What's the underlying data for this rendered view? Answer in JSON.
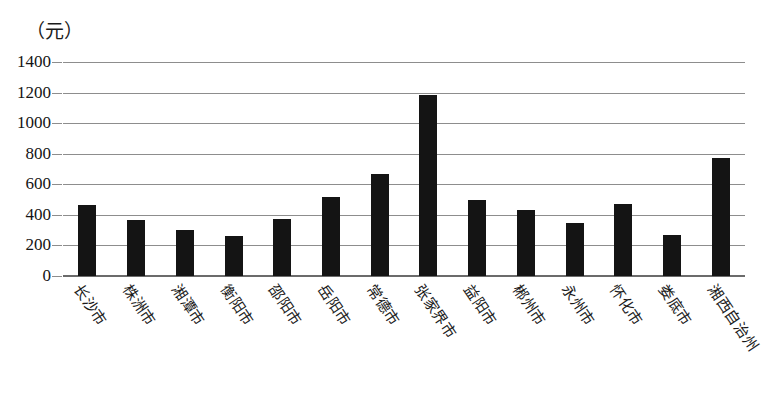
{
  "chart_data": {
    "type": "bar",
    "title": "",
    "subtitle": "",
    "unit_label": "（元）",
    "xlabel": "",
    "ylabel": "",
    "ylim": [
      0,
      1400
    ],
    "ytick_step": 200,
    "yticks": [
      "0",
      "200",
      "400",
      "600",
      "800",
      "1000",
      "1200",
      "1400"
    ],
    "grid": true,
    "legend": false,
    "legend_position": "none",
    "bar_color": "#141414",
    "grid_color": "#8d8d8d",
    "axis_color": "#6b6b6b",
    "categories": [
      "长沙市",
      "株洲市",
      "湘潭市",
      "衡阳市",
      "邵阳市",
      "岳阳市",
      "常德市",
      "张家界市",
      "益阳市",
      "郴州市",
      "永州市",
      "怀化市",
      "娄底市",
      "湘西自治州"
    ],
    "values": [
      465,
      365,
      300,
      265,
      370,
      520,
      670,
      1185,
      500,
      435,
      345,
      470,
      270,
      775
    ]
  }
}
